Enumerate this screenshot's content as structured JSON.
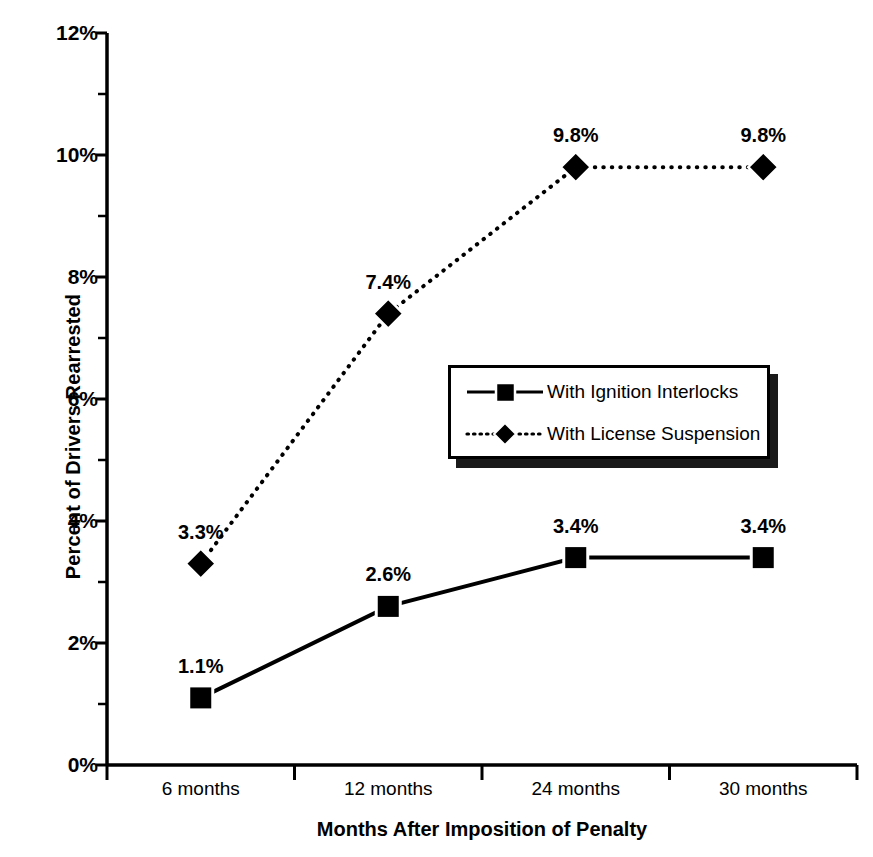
{
  "chart_data": {
    "type": "line",
    "title": "",
    "xlabel": "Months After Imposition of Penalty",
    "ylabel": "Percent of Drivers Rearrested",
    "categories": [
      "6 months",
      "12 months",
      "24 months",
      "30 months"
    ],
    "ylim": [
      0,
      12
    ],
    "ytick_labels": [
      "0%",
      "2%",
      "4%",
      "6%",
      "8%",
      "10%",
      "12%"
    ],
    "ytick_values": [
      0,
      2,
      4,
      6,
      8,
      10,
      12
    ],
    "yminor_step": 0.5,
    "grid": false,
    "legend_position": "center-right",
    "series": [
      {
        "name": "With Ignition Interlocks",
        "marker": "square",
        "linestyle": "solid",
        "color": "#000000",
        "values": [
          1.1,
          2.6,
          3.4,
          3.4
        ],
        "point_labels": [
          "1.1%",
          "2.6%",
          "3.4%",
          "3.4%"
        ]
      },
      {
        "name": "With License Suspension",
        "marker": "diamond",
        "linestyle": "dotted",
        "color": "#000000",
        "values": [
          3.3,
          7.4,
          9.8,
          9.8
        ],
        "point_labels": [
          "3.3%",
          "7.4%",
          "9.8%",
          "9.8%"
        ]
      }
    ]
  },
  "legend": {
    "entries": [
      {
        "label": "With Ignition Interlocks"
      },
      {
        "label": "With License Suspension"
      }
    ]
  }
}
